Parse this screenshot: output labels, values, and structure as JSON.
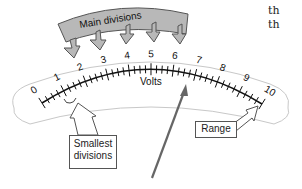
{
  "diagram": {
    "scale_unit_label": "Volts",
    "scale_labels": [
      "0",
      "1",
      "2",
      "3",
      "4",
      "5",
      "6",
      "7",
      "8",
      "9",
      "10"
    ],
    "main_divisions_label": "Main divisions",
    "smallest_divisions_label_line1": "Smallest",
    "smallest_divisions_label_line2": "divisions",
    "range_label": "Range",
    "side_text_line1": "th",
    "side_text_line2": "th",
    "colors": {
      "banner_fill": "#b8b8b8",
      "banner_stroke": "#555555",
      "needle": "#666666",
      "scale": "#111111",
      "face_outline": "#c8c8c8"
    }
  }
}
